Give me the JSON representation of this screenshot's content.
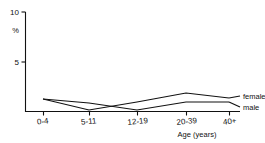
{
  "chart_data": {
    "type": "line",
    "title": "",
    "subtitle": "",
    "xlabel": "Age (years)",
    "ylabel": "%",
    "categories": [
      "0-4",
      "5-11",
      "12-19",
      "20-39",
      "40+"
    ],
    "series": [
      {
        "name": "female",
        "values": [
          1.3,
          0.2,
          1.0,
          1.9,
          1.4
        ]
      },
      {
        "name": "male",
        "values": [
          1.3,
          0.9,
          0.2,
          1.0,
          1.0
        ]
      }
    ],
    "ylim": [
      0,
      10
    ],
    "yticks": [
      5,
      10
    ],
    "ytick_labels": [
      "5",
      "10"
    ],
    "xtick_labels": [
      "0-4",
      "5-11",
      "12-19",
      "20-39",
      "40+"
    ],
    "grid": false,
    "legend_position": "right-inline",
    "legend_entries": [
      "female",
      "male"
    ],
    "line_color": "#111111",
    "background_color": "#ffffff"
  },
  "axes": {
    "y_top_label": "10",
    "y_mid_label": "5",
    "y_unit_label": "%"
  },
  "x_axis": {
    "title": "Age (years)",
    "ticks": [
      {
        "label": "0-4"
      },
      {
        "label": "5-11"
      },
      {
        "label": "12-19"
      },
      {
        "label": "20-39"
      },
      {
        "label": "40+"
      }
    ]
  },
  "legend": {
    "female_label": "female",
    "male_label": "male"
  }
}
